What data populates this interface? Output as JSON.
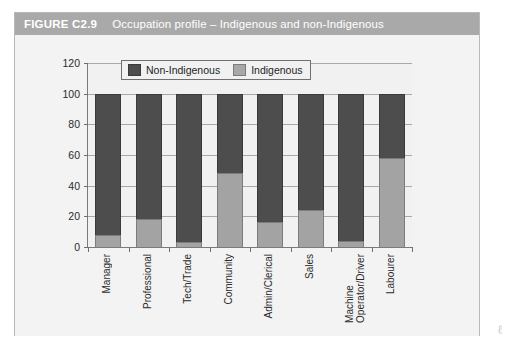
{
  "figure": {
    "number": "FIGURE C2.9",
    "caption": "Occupation profile – Indigenous and non-Indigenous",
    "titlebar_color": "#a9a9a9",
    "frame_bg": "#f3f3f3",
    "plot_bg": "#f1f1f1"
  },
  "legend": {
    "position": "top-left-inside",
    "entries": [
      {
        "label": "Non-Indigenous",
        "color": "#4d4d4d",
        "swatch": "dark-gray-swatch"
      },
      {
        "label": "Indigenous",
        "color": "#a8a8a8",
        "swatch": "light-gray-swatch"
      }
    ]
  },
  "axes": {
    "y_ticks": [
      "120",
      "100",
      "80",
      "60",
      "40",
      "20",
      "0"
    ],
    "y_tick_values": [
      120,
      100,
      80,
      60,
      40,
      20,
      0
    ],
    "ylim": [
      0,
      120
    ],
    "grid": true
  },
  "page_marks": {
    "corner_smudge": "ℓ"
  },
  "chart_data": {
    "type": "bar",
    "stacked": true,
    "orientation": "vertical",
    "title": "Occupation profile – Indigenous and non-Indigenous",
    "xlabel": "",
    "ylabel": "",
    "ylim": [
      0,
      120
    ],
    "ytick_step": 20,
    "grid": true,
    "legend_position": "upper left (inside plot)",
    "categories": [
      "Manager",
      "Professional",
      "Tech/Trade",
      "Community",
      "Admin/Clerical",
      "Sales",
      "Machine\nOperator/Driver",
      "Labourer"
    ],
    "series": [
      {
        "name": "Indigenous",
        "color": "#a3a3a3",
        "values": [
          8,
          18,
          3,
          48,
          16,
          24,
          4,
          58
        ]
      },
      {
        "name": "Non-Indigenous",
        "color": "#4d4d4d",
        "values": [
          92,
          82,
          97,
          52,
          84,
          76,
          96,
          42
        ]
      }
    ],
    "totals": [
      100,
      100,
      100,
      100,
      100,
      100,
      100,
      100
    ]
  }
}
